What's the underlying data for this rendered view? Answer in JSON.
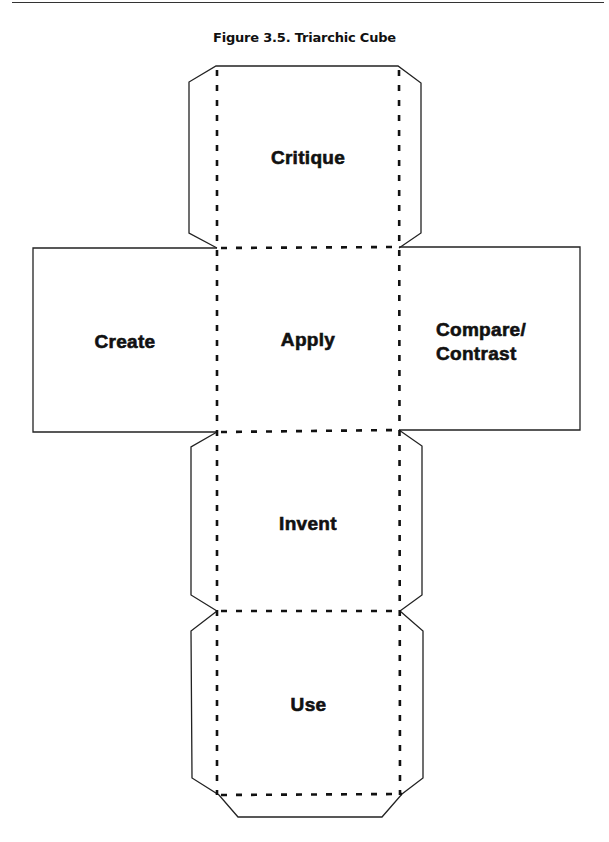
{
  "figure": {
    "title": "Figure 3.5. Triarchic Cube"
  },
  "cube_net": {
    "faces": {
      "top": {
        "label": "Critique"
      },
      "left": {
        "label": "Create"
      },
      "center": {
        "label": "Apply"
      },
      "right": {
        "label_line1": "Compare/",
        "label_line2": "Contrast"
      },
      "lower": {
        "label": "Invent"
      },
      "bottom": {
        "label": "Use"
      }
    },
    "line_color": "#222222",
    "fold_line_style": "dashed"
  }
}
